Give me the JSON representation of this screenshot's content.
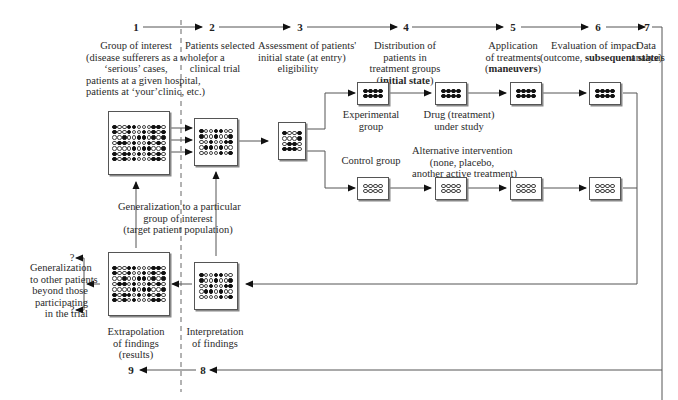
{
  "steps": [
    {
      "num": "1",
      "lines": [
        "Group of interest",
        "(disease sufferers as a whole,",
        "‘serious’ cases,",
        "patients at a given hospital,",
        "patients at ‘your’clinic, etc.)"
      ]
    },
    {
      "num": "2",
      "lines": [
        "Patients selected",
        "for a",
        "clinical trial"
      ]
    },
    {
      "num": "3",
      "lines": [
        "Assessment of patients'",
        "initial state (at entry)",
        "eligibility"
      ]
    },
    {
      "num": "4",
      "lines": [
        "Distribution of",
        "patients in",
        "treatment groups"
      ],
      "bold_line": "initial state"
    },
    {
      "num": "5",
      "lines": [
        "Application",
        "of treatments"
      ],
      "bold_line": "maneuvers"
    },
    {
      "num": "6",
      "lines": [
        "Evaluation of impact"
      ],
      "line2_prefix": "(outcome, ",
      "line2_bold": "subsequent state",
      "line2_suffix": ")"
    },
    {
      "num": "7",
      "lines": [
        "Data",
        "analysis"
      ]
    },
    {
      "num": "8",
      "lines": [
        "Interpretation",
        "of findings"
      ]
    },
    {
      "num": "9",
      "lines": [
        "Extrapolation",
        "of findings",
        "(results)"
      ]
    }
  ],
  "labels": {
    "experimental_group": [
      "Experimental",
      "group"
    ],
    "drug": [
      "Drug (treatment)",
      "under study"
    ],
    "control_group": "Control group",
    "alternative": [
      "Alternative intervention",
      "(none, placebo,",
      "another active treatment)"
    ],
    "generalization_target": [
      "Generalization to a particular",
      "group of interest",
      "(target patient population)"
    ],
    "generalization_other": [
      "Generalization",
      "to other patients",
      "beyond those",
      "participating",
      "in the trial"
    ],
    "question_mark": "?"
  },
  "grids": {
    "population": [
      "●○○●●○○○●●○",
      "●○○●○○●○●○●",
      "○○●○○●●○●○●",
      "○●●○●○○●○●○",
      "○○○○●○●●○○●",
      "●○●●○●○●○●○",
      "●○●○●○○○●●○"
    ],
    "selected": [
      "●○○●●○○",
      "●○○●○○●",
      "○○●○○●●",
      "○●●○●○○",
      "○○○○●○●"
    ],
    "assessed": [
      "●○○●",
      "○○○●",
      "○●●○",
      "●●●○"
    ],
    "experimental": [
      "●●●●",
      "●●●●"
    ],
    "control": [
      "○○○○",
      "○○○○"
    ],
    "interpretation": [
      "●○○●●○○",
      "●○○●○○●",
      "○○●○○●●",
      "○●●○●○○",
      "○○○○●○●"
    ],
    "extrapolation": [
      "●○○●●○○○●●○",
      "●○○●○○●○●○●",
      "○○●○○●●○●○●",
      "○●●○●○○●○●○",
      "○○○○●○●●○○●",
      "●○●●○●○●○●○",
      "●○●○●○○○●●○"
    ]
  }
}
